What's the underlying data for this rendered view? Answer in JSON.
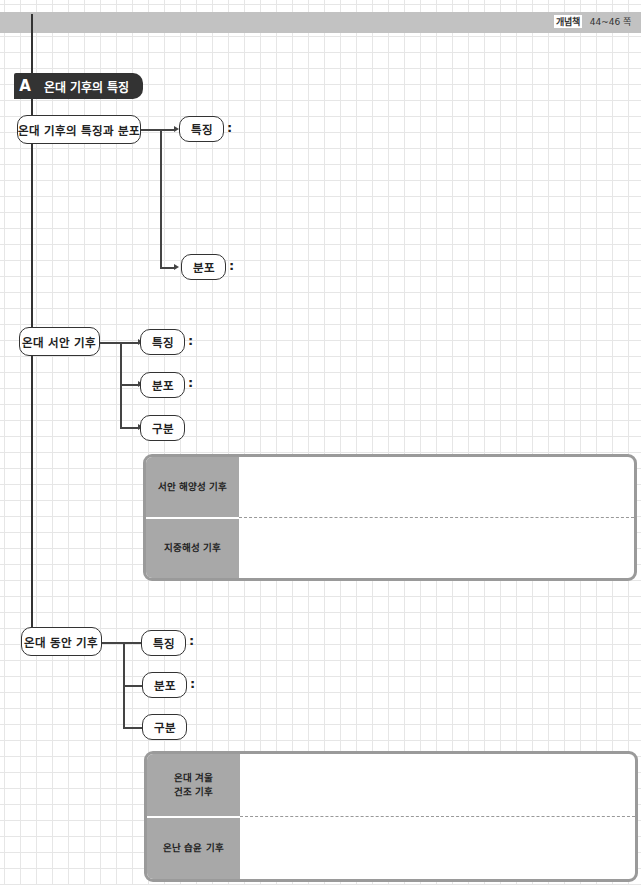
{
  "header": {
    "book_label": "개념책",
    "page_range": "44~46 쪽"
  },
  "section": {
    "letter": "A",
    "title": "온대 기후의 특징"
  },
  "groups": [
    {
      "title": "온대 기후의 특징과 분포",
      "children": [
        {
          "label": "특징",
          "colon": ":"
        },
        {
          "label": "분포",
          "colon": ":"
        }
      ]
    },
    {
      "title": "온대 서안 기후",
      "children": [
        {
          "label": "특징",
          "colon": ":"
        },
        {
          "label": "분포",
          "colon": ":"
        },
        {
          "label": "구분",
          "colon": ""
        }
      ],
      "table": {
        "rows": [
          {
            "label": "서안 해양성 기후",
            "value": ""
          },
          {
            "label": "지중해성 기후",
            "value": ""
          }
        ]
      }
    },
    {
      "title": "온대 동안 기후",
      "children": [
        {
          "label": "특징",
          "colon": ":"
        },
        {
          "label": "분포",
          "colon": ":"
        },
        {
          "label": "구분",
          "colon": ""
        }
      ],
      "table": {
        "rows": [
          {
            "label": "온대 겨울\n건조 기후",
            "value": ""
          },
          {
            "label": "온난 습윤 기후",
            "value": ""
          }
        ]
      }
    }
  ]
}
